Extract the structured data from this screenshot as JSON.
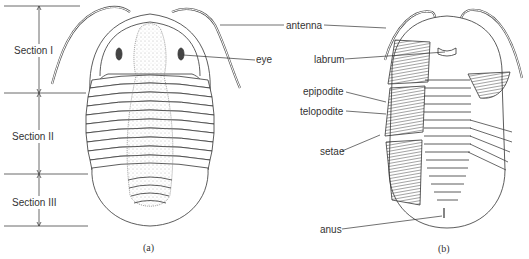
{
  "figure": {
    "panel_a": {
      "caption": "(a)",
      "sections": [
        {
          "label": "Section I"
        },
        {
          "label": "Section II"
        },
        {
          "label": "Section III"
        }
      ],
      "labels": {
        "eye": "eye"
      }
    },
    "shared_labels": {
      "antenna": "antenna"
    },
    "panel_b": {
      "caption": "(b)",
      "labels": {
        "labrum": "labrum",
        "epipodite": "epipodite",
        "telopodite": "telopodite",
        "setae": "setae",
        "anus": "anus"
      }
    }
  }
}
